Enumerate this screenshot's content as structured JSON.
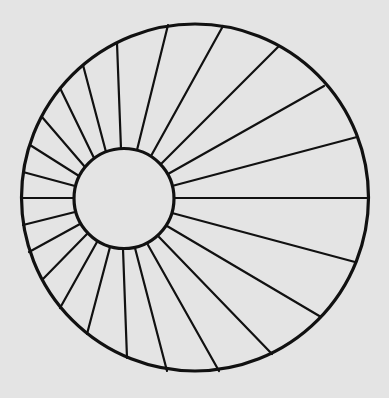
{
  "diagram": {
    "description": "Outer circle with off-center inner circle connected by radial spokes",
    "background_color": "#e4e4e4",
    "stroke_color": "#111111",
    "outer_circle": {
      "cx": 195,
      "cy": 197.5,
      "r": 173.5,
      "stroke_width": 3.2
    },
    "inner_circle": {
      "cx": 124,
      "cy": 198.5,
      "r": 50,
      "stroke_width": 3.2
    },
    "spoke_stroke_width": 2.2,
    "spokes": [
      {
        "x1": 117,
        "y1": 43,
        "x2": 121,
        "y2": 149
      },
      {
        "x1": 83,
        "y1": 65,
        "x2": 106,
        "y2": 152
      },
      {
        "x1": 60,
        "y1": 88,
        "x2": 94,
        "y2": 158
      },
      {
        "x1": 42,
        "y1": 117,
        "x2": 85,
        "y2": 167
      },
      {
        "x1": 30,
        "y1": 145,
        "x2": 79,
        "y2": 176
      },
      {
        "x1": 23,
        "y1": 172,
        "x2": 75,
        "y2": 186
      },
      {
        "x1": 21,
        "y1": 198,
        "x2": 74,
        "y2": 198
      },
      {
        "x1": 168,
        "y1": 25,
        "x2": 137,
        "y2": 150
      },
      {
        "x1": 223,
        "y1": 26,
        "x2": 151,
        "y2": 156
      },
      {
        "x1": 278,
        "y1": 47,
        "x2": 161,
        "y2": 164
      },
      {
        "x1": 324,
        "y1": 86,
        "x2": 168,
        "y2": 174
      },
      {
        "x1": 357,
        "y1": 137,
        "x2": 172,
        "y2": 186
      },
      {
        "x1": 369,
        "y1": 198,
        "x2": 174,
        "y2": 198
      },
      {
        "x1": 355,
        "y1": 262,
        "x2": 172,
        "y2": 213
      },
      {
        "x1": 321,
        "y1": 317,
        "x2": 167,
        "y2": 226
      },
      {
        "x1": 272,
        "y1": 354,
        "x2": 159,
        "y2": 237
      },
      {
        "x1": 219,
        "y1": 371,
        "x2": 148,
        "y2": 245
      },
      {
        "x1": 167,
        "y1": 371,
        "x2": 135,
        "y2": 248
      },
      {
        "x1": 127,
        "y1": 358,
        "x2": 123,
        "y2": 249
      },
      {
        "x1": 87,
        "y1": 334,
        "x2": 110,
        "y2": 247
      },
      {
        "x1": 60,
        "y1": 308,
        "x2": 97,
        "y2": 242
      },
      {
        "x1": 42,
        "y1": 280,
        "x2": 87,
        "y2": 234
      },
      {
        "x1": 29,
        "y1": 252,
        "x2": 80,
        "y2": 224
      },
      {
        "x1": 23,
        "y1": 225,
        "x2": 75,
        "y2": 212
      }
    ]
  }
}
